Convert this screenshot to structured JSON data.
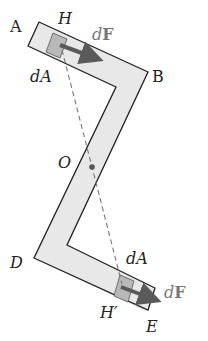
{
  "figure": {
    "colors": {
      "bar_fill": "#e8e8e8",
      "bar_stroke": "#222222",
      "patch_fill": "#b8b8b8",
      "arrow": "#5a5a5a",
      "dashed": "#777777",
      "label_dark": "#222222",
      "label_gray": "#777777"
    },
    "labels": {
      "A": "A",
      "H": "H",
      "dF_top_d": "d",
      "dF_top_F": "F",
      "B": "B",
      "dA_top": "dA",
      "O": "O",
      "D": "D",
      "dA_bottom": "dA",
      "dF_bottom_d": "d",
      "dF_bottom_F": "F",
      "H_prime": "H′",
      "E": "E"
    }
  }
}
